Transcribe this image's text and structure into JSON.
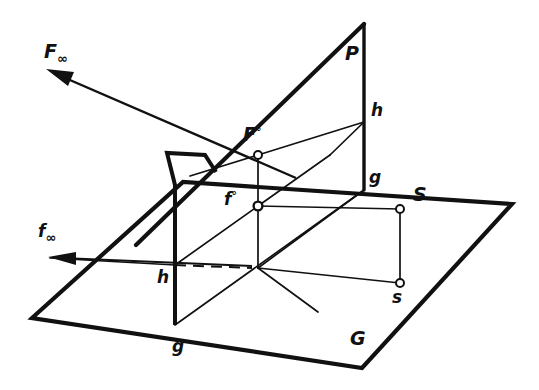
{
  "figure": {
    "background_color": "#ffffff",
    "line_color": "#111111",
    "labels": {
      "F_infinity": {
        "text": "F",
        "subscript": "∞",
        "x": 44,
        "y": 58,
        "size": "lg",
        "name": "label-F-infinity"
      },
      "f_infinity": {
        "text": "f",
        "subscript": "∞",
        "x": 38,
        "y": 237,
        "size": "md",
        "name": "label-f-infinity"
      },
      "P": {
        "text": "P",
        "subscript": "",
        "x": 345,
        "y": 60,
        "size": "lg",
        "name": "label-P"
      },
      "h_upper": {
        "text": "h",
        "subscript": "",
        "x": 371,
        "y": 116,
        "size": "md",
        "name": "label-h-upper"
      },
      "g_upper": {
        "text": "g",
        "subscript": "",
        "x": 369,
        "y": 183,
        "size": "md",
        "name": "label-g-upper"
      },
      "S": {
        "text": "S",
        "subscript": "",
        "x": 413,
        "y": 201,
        "size": "lg",
        "name": "label-S"
      },
      "s": {
        "text": "s",
        "subscript": "",
        "x": 392,
        "y": 303,
        "size": "md",
        "name": "label-s"
      },
      "F_zero": {
        "text": "F",
        "subscript": "°",
        "x": 243,
        "y": 141,
        "size": "lg",
        "name": "label-F-zero"
      },
      "f_zero": {
        "text": "f",
        "subscript": "°",
        "x": 224,
        "y": 205,
        "size": "md",
        "name": "label-f-zero"
      },
      "h_lower": {
        "text": "h",
        "subscript": "",
        "x": 157,
        "y": 283,
        "size": "md",
        "name": "label-h-lower"
      },
      "g_lower": {
        "text": "g",
        "subscript": "",
        "x": 172,
        "y": 352,
        "size": "md",
        "name": "label-g-lower"
      },
      "G": {
        "text": "G",
        "subscript": "",
        "x": 350,
        "y": 345,
        "size": "lg",
        "name": "label-G"
      }
    },
    "points": [
      {
        "name": "point-F-zero",
        "x": 258,
        "y": 155,
        "style": "open"
      },
      {
        "name": "point-f-zero",
        "x": 258,
        "y": 206,
        "style": "open"
      },
      {
        "name": "point-S",
        "x": 400,
        "y": 209,
        "style": "open"
      },
      {
        "name": "point-s",
        "x": 400,
        "y": 283,
        "style": "open"
      }
    ],
    "ground_plane_outline": "32,318 183,182 512,204 362,368",
    "vertical_plane_outline": "175,325 175,185 167,153 205,155 214,170 214,238",
    "arrows": [
      {
        "name": "arrow-F-infinity",
        "from": [
          296,
          178
        ],
        "to": [
          48,
          70
        ]
      },
      {
        "name": "arrow-f-infinity",
        "from": [
          252,
          268
        ],
        "to": [
          50,
          258
        ]
      }
    ],
    "dashed_segment": {
      "name": "hidden-line-h",
      "from": [
        175,
        265
      ],
      "to": [
        252,
        268
      ]
    }
  }
}
